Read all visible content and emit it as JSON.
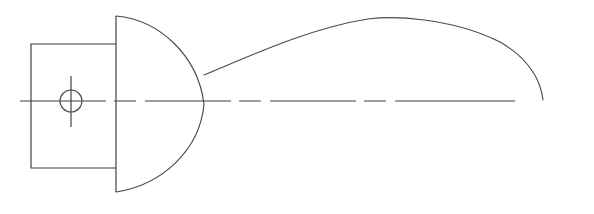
{
  "document": {
    "type": "technical-line-drawing",
    "title": "Engineering Part Cross-Section",
    "description": "Monochrome 2D engineering line drawing showing a rectangular body with a bolt-hole, a domed end cap, and a long tapering profile curve along a dashed horizontal centerline.",
    "background_color": "#ffffff",
    "line_color": "#3a3a3a",
    "width": 594,
    "height": 214
  },
  "geometry": {
    "centerline": {
      "label": "horizontal-axis-centerline",
      "y": 101,
      "x_start": 20,
      "x_end": 578,
      "dash_pattern": "86 8 22 9 86 8 22 9 86 8 22 9 120",
      "style": "dash-dot centerline"
    },
    "rectangle": {
      "label": "rectangular-body",
      "x": 31,
      "y": 44,
      "width": 85,
      "height": 124,
      "right_edge_x": 116,
      "bottom_edge_y": 168
    },
    "bolt_circle": {
      "label": "bolt-hole",
      "cx": 71,
      "cy": 101,
      "r": 11
    },
    "crosshair_vertical": {
      "label": "bolt-hole-vertical-crosshair",
      "x": 71,
      "y_start": 76,
      "y_end": 127
    },
    "flange_line": {
      "label": "dome-base-vertical-line",
      "x": 116,
      "y_start": 16,
      "y_end": 192
    },
    "dome": {
      "label": "domed-end-cap",
      "top": {
        "x": 116,
        "y": 16
      },
      "apex": {
        "x": 204,
        "y": 104
      },
      "bottom": {
        "x": 116,
        "y": 192
      },
      "path": "M 116 16 C 160 20, 198 56, 204 104 C 200 150, 162 185, 116 192"
    },
    "profile_curve": {
      "label": "tapering-profile-curve",
      "start": {
        "x": 204,
        "y": 75
      },
      "peak": {
        "x": 392,
        "y": 17
      },
      "end": {
        "x": 543,
        "y": 100
      },
      "path": "M 204 75 C 250 56, 310 28, 368 19 C 392 16, 450 17, 500 42 C 528 58, 541 80, 543 100"
    }
  }
}
